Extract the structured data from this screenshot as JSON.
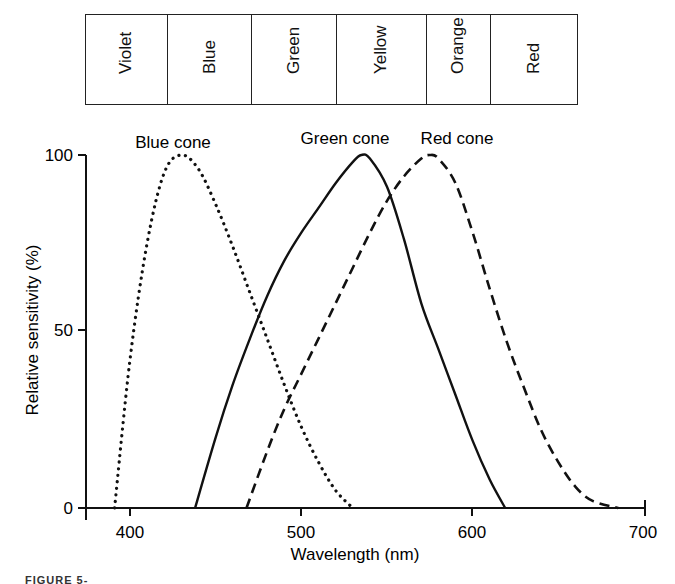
{
  "spectrum_bands": [
    {
      "label": "Violet",
      "width": 82
    },
    {
      "label": "Blue",
      "width": 85
    },
    {
      "label": "Green",
      "width": 85
    },
    {
      "label": "Yellow",
      "width": 90
    },
    {
      "label": "Orange",
      "width": 65
    },
    {
      "label": "Red",
      "width": 86
    }
  ],
  "chart_data": {
    "type": "line",
    "title": "",
    "xlabel": "Wavelength (nm)",
    "ylabel": "Relative sensitivity (%)",
    "xlim": [
      375,
      700
    ],
    "ylim": [
      0,
      100
    ],
    "xticks": [
      400,
      500,
      600,
      700
    ],
    "yticks": [
      0,
      50,
      100
    ],
    "grid": false,
    "legend": "inline labels above peaks",
    "series": [
      {
        "name": "Blue cone",
        "style": "dotted",
        "x": [
          391,
          400,
          410,
          420,
          430,
          440,
          450,
          460,
          470,
          480,
          490,
          500,
          510,
          520,
          530
        ],
        "y": [
          0,
          42,
          75,
          95,
          100,
          96,
          86,
          74,
          61,
          48,
          35,
          23,
          13,
          5,
          0
        ]
      },
      {
        "name": "Green cone",
        "style": "solid",
        "x": [
          438,
          450,
          460,
          470,
          480,
          490,
          500,
          510,
          520,
          530,
          535,
          540,
          550,
          560,
          570,
          580,
          590,
          600,
          610,
          619
        ],
        "y": [
          0,
          20,
          35,
          48,
          60,
          70,
          78,
          85,
          92,
          98,
          100,
          99,
          91,
          76,
          58,
          45,
          32,
          19,
          8,
          0
        ]
      },
      {
        "name": "Red cone",
        "style": "dashed",
        "x": [
          468,
          480,
          490,
          500,
          510,
          520,
          530,
          540,
          550,
          560,
          570,
          575,
          580,
          590,
          600,
          610,
          620,
          630,
          640,
          650,
          660,
          670,
          685
        ],
        "y": [
          0,
          16,
          28,
          38,
          48,
          58,
          68,
          78,
          87,
          94,
          99,
          100,
          99,
          92,
          78,
          62,
          47,
          34,
          22,
          13,
          6,
          2,
          0
        ]
      }
    ]
  },
  "labels": {
    "blue_cone": "Blue cone",
    "green_cone": "Green cone",
    "red_cone": "Red cone",
    "xlabel": "Wavelength (nm)",
    "ylabel": "Relative sensitivity (%)",
    "y0": "0",
    "y50": "50",
    "y100": "100",
    "x400": "400",
    "x500": "500",
    "x600": "600",
    "x700": "700"
  },
  "caption": "FIGURE 5-"
}
